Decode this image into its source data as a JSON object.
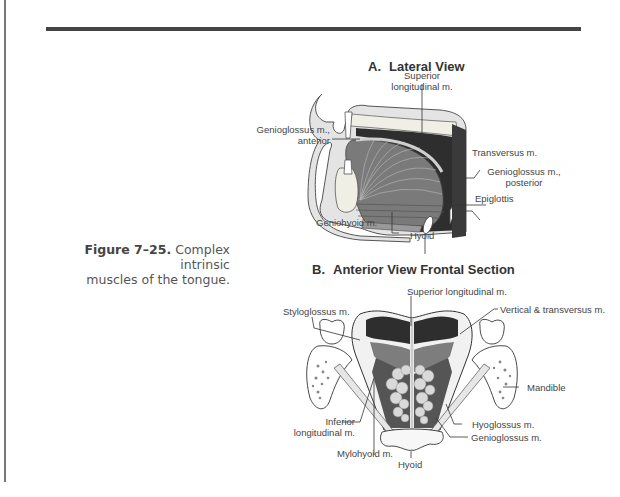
{
  "caption": {
    "figure_number": "Figure 7–25.",
    "text_line1": "Complex intrinsic",
    "text_line2": "muscles of the tongue."
  },
  "panel_a": {
    "letter": "A.",
    "title": "Lateral View",
    "labels": {
      "superior_longitudinal_1": "Superior",
      "superior_longitudinal_2": "longitudinal m.",
      "transversus": "Transversus m.",
      "genioglossus_anterior_1": "Genioglossus m.,",
      "genioglossus_anterior_2": "anterior",
      "genioglossus_posterior_1": "Genioglossus m.,",
      "genioglossus_posterior_2": "posterior",
      "epiglottis": "Epiglottis",
      "geniohyoid": "Geniohyoid m.",
      "hyoid": "Hyoid"
    }
  },
  "panel_b": {
    "letter": "B.",
    "title": "Anterior View Frontal Section",
    "labels": {
      "superior_longitudinal": "Superior longitudinal m.",
      "styloglossus": "Styloglossus m.",
      "vertical_transversus": "Vertical & transversus m.",
      "mandible": "Mandible",
      "inferior_longitudinal_1": "Inferior",
      "inferior_longitudinal_2": "longitudinal m.",
      "hyoglossus": "Hyoglossus m.",
      "genioglossus": "Genioglossus m.",
      "mylohyoid": "Mylohyoid m.",
      "hyoid": "Hyoid"
    }
  }
}
